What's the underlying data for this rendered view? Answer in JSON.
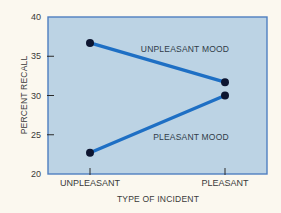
{
  "chart_data": {
    "type": "line",
    "title": "",
    "xlabel": "TYPE OF INCIDENT",
    "ylabel": "PERCENT RECALL",
    "categories": [
      "UNPLEASANT",
      "PLEASANT"
    ],
    "ylim": [
      20,
      40
    ],
    "yticks": [
      20,
      25,
      30,
      35,
      40
    ],
    "grid": false,
    "legend": "inline labels on lines",
    "series": [
      {
        "name": "UNPLEASANT MOOD",
        "values": [
          36.7,
          31.7
        ]
      },
      {
        "name": "PLEASANT MOOD",
        "values": [
          22.7,
          30.0
        ]
      }
    ]
  },
  "colors": {
    "background": "#fbf8ef",
    "plot_fill": "#bcd3e4",
    "frame": "#4f7fc0",
    "line": "#1e6fc4",
    "marker": "#0d1530",
    "text": "#3a3a3a"
  }
}
